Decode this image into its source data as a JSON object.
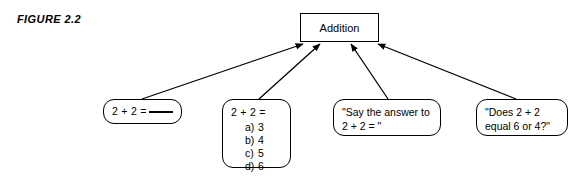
{
  "figure": {
    "label": "FIGURE 2.2"
  },
  "diagram": {
    "type": "convergent-arrow-diagram",
    "concept_node": {
      "label": "Addition",
      "shape": "rectangle"
    },
    "example_nodes": [
      {
        "id": "fill-in-blank",
        "shape": "rounded-rectangle",
        "lines": [
          "2 + 2 = "
        ],
        "has_blank": true
      },
      {
        "id": "multiple-choice",
        "shape": "rounded-rectangle",
        "stem": "2 + 2 =",
        "choices": [
          {
            "letter": "a)",
            "value": "3"
          },
          {
            "letter": "b)",
            "value": "4"
          },
          {
            "letter": "c)",
            "value": "5"
          },
          {
            "letter": "d)",
            "value": "6"
          }
        ]
      },
      {
        "id": "say-the-answer",
        "shape": "rounded-rectangle",
        "lines": [
          "\"Say the answer to",
          "2 + 2 = \""
        ]
      },
      {
        "id": "does-equal",
        "shape": "rounded-rectangle",
        "lines": [
          "\"Does 2 + 2",
          "equal 6 or 4?\""
        ]
      }
    ],
    "arrows": [
      {
        "from": "fill-in-blank",
        "to": "concept",
        "direction": "up-right"
      },
      {
        "from": "multiple-choice",
        "to": "concept",
        "direction": "up-right"
      },
      {
        "from": "say-the-answer",
        "to": "concept",
        "direction": "up-left"
      },
      {
        "from": "does-equal",
        "to": "concept",
        "direction": "up-left"
      }
    ]
  },
  "colors": {
    "stroke": "#000000",
    "background": "#ffffff",
    "text": "#000000"
  }
}
